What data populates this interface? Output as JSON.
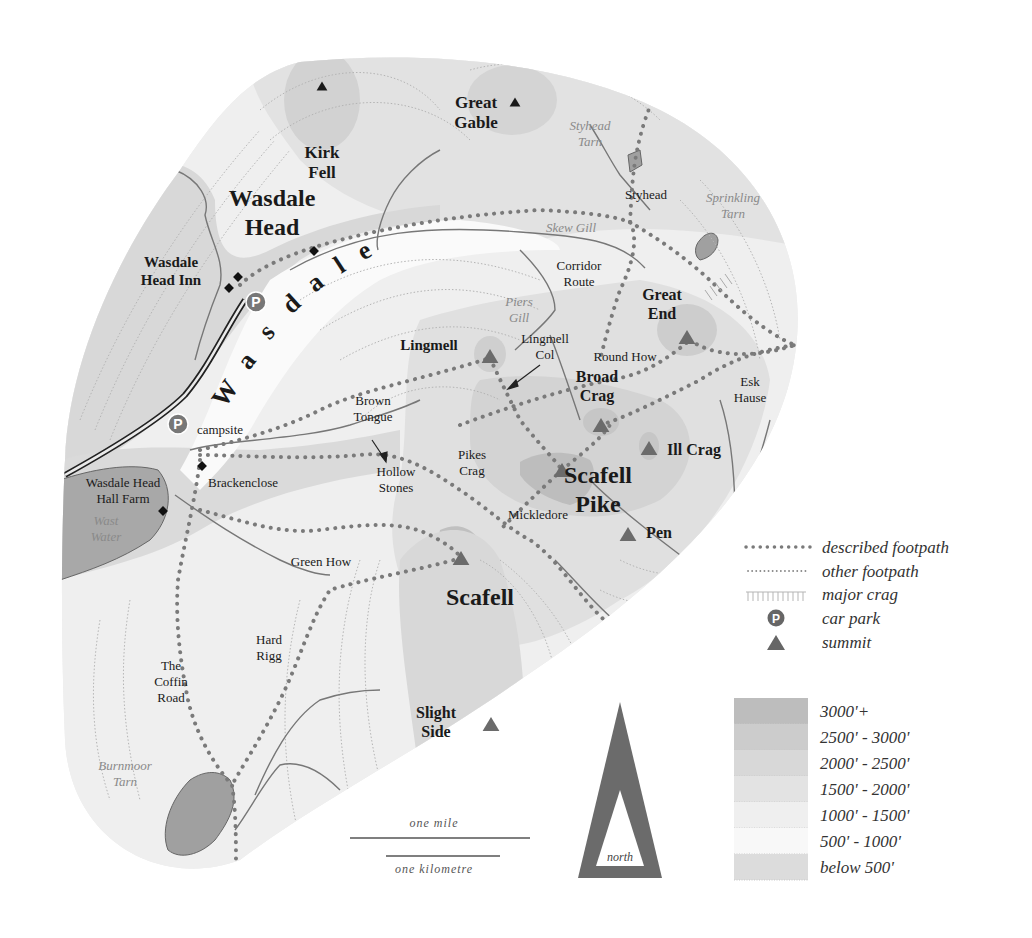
{
  "colors": {
    "summit": "#6b6b6b",
    "summit_dark": "#1a1a1a",
    "path": "#7d7d7d",
    "stream": "#777777",
    "water": "#9a9a9a",
    "road": "#2a2a2a",
    "band_3000": "#bdbdbd",
    "band_2500": "#cccccc",
    "band_2000": "#d8d8d8",
    "band_1500": "#e3e3e3",
    "band_1000": "#ededed",
    "band_500": "#f6f6f6",
    "band_below500": "#dcdcdc",
    "contour": "#b0b0b0"
  },
  "map": {
    "labels": [
      {
        "id": "kirk-fell",
        "lines": [
          "Kirk",
          "Fell"
        ],
        "x": 322,
        "y": 158,
        "size": 17,
        "style": "bold"
      },
      {
        "id": "great-gable",
        "lines": [
          "Great",
          "Gable"
        ],
        "x": 476,
        "y": 108,
        "size": 17,
        "style": "bold"
      },
      {
        "id": "styhead-tarn",
        "lines": [
          "Styhead",
          "Tarn"
        ],
        "x": 590,
        "y": 130,
        "size": 13,
        "style": "italic-grey"
      },
      {
        "id": "wasdale-head",
        "lines": [
          "Wasdale",
          "Head"
        ],
        "x": 272,
        "y": 206,
        "size": 24,
        "style": "bold"
      },
      {
        "id": "styhead",
        "lines": [
          "Styhead"
        ],
        "x": 646,
        "y": 199,
        "size": 13,
        "style": "normal"
      },
      {
        "id": "sprinkling-tarn",
        "lines": [
          "Sprinkling",
          "Tarn"
        ],
        "x": 733,
        "y": 202,
        "size": 13,
        "style": "italic-grey"
      },
      {
        "id": "skew-gill",
        "lines": [
          "Skew Gill"
        ],
        "x": 571,
        "y": 232,
        "size": 13,
        "style": "italic-grey"
      },
      {
        "id": "wasdale-head-inn",
        "lines": [
          "Wasdale",
          "Head Inn"
        ],
        "x": 171,
        "y": 267,
        "size": 15,
        "style": "bold"
      },
      {
        "id": "corridor-route",
        "lines": [
          "Corridor",
          "Route"
        ],
        "x": 579,
        "y": 270,
        "size": 13,
        "style": "normal"
      },
      {
        "id": "great-end",
        "lines": [
          "Great",
          "End"
        ],
        "x": 662,
        "y": 300,
        "size": 16,
        "style": "bold"
      },
      {
        "id": "piers-gill",
        "lines": [
          "Piers",
          "Gill"
        ],
        "x": 519,
        "y": 306,
        "size": 13,
        "style": "italic-grey"
      },
      {
        "id": "lingmell",
        "lines": [
          "Lingmell"
        ],
        "x": 429,
        "y": 350,
        "size": 15,
        "style": "bold"
      },
      {
        "id": "lingmell-col",
        "lines": [
          "Lingmell",
          "Col"
        ],
        "x": 545,
        "y": 343,
        "size": 13,
        "style": "normal"
      },
      {
        "id": "round-how",
        "lines": [
          "Round How"
        ],
        "x": 625,
        "y": 361,
        "size": 13,
        "style": "normal"
      },
      {
        "id": "broad-crag",
        "lines": [
          "Broad",
          "Crag"
        ],
        "x": 597,
        "y": 382,
        "size": 16,
        "style": "bold"
      },
      {
        "id": "esk-hause",
        "lines": [
          "Esk",
          "Hause"
        ],
        "x": 750,
        "y": 386,
        "size": 13,
        "style": "normal"
      },
      {
        "id": "brown-tongue",
        "lines": [
          "Brown",
          "Tongue"
        ],
        "x": 373,
        "y": 405,
        "size": 13,
        "style": "normal"
      },
      {
        "id": "ill-crag",
        "lines": [
          "Ill Crag"
        ],
        "x": 694,
        "y": 455,
        "size": 16,
        "style": "bold"
      },
      {
        "id": "campsite",
        "lines": [
          "campsite"
        ],
        "x": 220,
        "y": 434,
        "size": 13,
        "style": "normal"
      },
      {
        "id": "pikes-crag",
        "lines": [
          "Pikes",
          "Crag"
        ],
        "x": 472,
        "y": 459,
        "size": 13,
        "style": "normal"
      },
      {
        "id": "hollow-stones",
        "lines": [
          "Hollow",
          "Stones"
        ],
        "x": 396,
        "y": 476,
        "size": 13,
        "style": "normal"
      },
      {
        "id": "scafell-pike",
        "lines": [
          "Scafell",
          "Pike"
        ],
        "x": 598,
        "y": 483,
        "size": 24,
        "style": "bold"
      },
      {
        "id": "wasdale-head-hall-farm",
        "lines": [
          "Wasdale Head",
          "Hall Farm"
        ],
        "x": 123,
        "y": 487,
        "size": 13,
        "style": "normal"
      },
      {
        "id": "brackenclose",
        "lines": [
          "Brackenclose"
        ],
        "x": 243,
        "y": 487,
        "size": 13,
        "style": "normal"
      },
      {
        "id": "wast-water",
        "lines": [
          "Wast",
          "Water"
        ],
        "x": 106,
        "y": 525,
        "size": 13,
        "style": "italic-grey"
      },
      {
        "id": "mickledore",
        "lines": [
          "Mickledore"
        ],
        "x": 538,
        "y": 519,
        "size": 13,
        "style": "normal"
      },
      {
        "id": "pen",
        "lines": [
          "Pen"
        ],
        "x": 659,
        "y": 538,
        "size": 16,
        "style": "bold"
      },
      {
        "id": "green-how",
        "lines": [
          "Green How"
        ],
        "x": 321,
        "y": 566,
        "size": 13,
        "style": "normal"
      },
      {
        "id": "scafell",
        "lines": [
          "Scafell"
        ],
        "x": 480,
        "y": 605,
        "size": 24,
        "style": "bold"
      },
      {
        "id": "hard-rigg",
        "lines": [
          "Hard",
          "Rigg"
        ],
        "x": 269,
        "y": 644,
        "size": 13,
        "style": "normal"
      },
      {
        "id": "the-coffin-road",
        "lines": [
          "The",
          "Coffin",
          "Road"
        ],
        "x": 171,
        "y": 670,
        "size": 13,
        "style": "normal"
      },
      {
        "id": "slight-side",
        "lines": [
          "Slight",
          "Side"
        ],
        "x": 436,
        "y": 718,
        "size": 16,
        "style": "bold"
      },
      {
        "id": "burnmoor-tarn",
        "lines": [
          "Burnmoor",
          "Tarn"
        ],
        "x": 125,
        "y": 770,
        "size": 13,
        "style": "italic-grey"
      }
    ],
    "valley_letters": [
      {
        "ch": "W",
        "x": 232,
        "y": 398,
        "rot": -55
      },
      {
        "ch": "a",
        "x": 253,
        "y": 366,
        "rot": -52
      },
      {
        "ch": "s",
        "x": 273,
        "y": 337,
        "rot": -48
      },
      {
        "ch": "d",
        "x": 297,
        "y": 310,
        "rot": -42
      },
      {
        "ch": "a",
        "x": 320,
        "y": 289,
        "rot": -38
      },
      {
        "ch": "l",
        "x": 344,
        "y": 272,
        "rot": -33
      },
      {
        "ch": "e",
        "x": 368,
        "y": 258,
        "rot": -28
      }
    ],
    "summits": [
      {
        "id": "kirk-fell-summit",
        "x": 322,
        "y": 86,
        "size": 9,
        "dark": true
      },
      {
        "id": "great-gable-summit",
        "x": 515,
        "y": 102,
        "size": 9,
        "dark": true
      },
      {
        "id": "great-end-summit",
        "x": 687,
        "y": 337,
        "size": 14,
        "dark": false
      },
      {
        "id": "lingmell-summit",
        "x": 490,
        "y": 356,
        "size": 14,
        "dark": false
      },
      {
        "id": "broad-crag-summit",
        "x": 601,
        "y": 425,
        "size": 14,
        "dark": false
      },
      {
        "id": "ill-crag-summit",
        "x": 649,
        "y": 448,
        "size": 14,
        "dark": false
      },
      {
        "id": "scafell-pike-summit",
        "x": 562,
        "y": 470,
        "size": 14,
        "dark": false
      },
      {
        "id": "pen-summit",
        "x": 628,
        "y": 534,
        "size": 14,
        "dark": false
      },
      {
        "id": "scafell-summit",
        "x": 461,
        "y": 558,
        "size": 14,
        "dark": false
      },
      {
        "id": "slight-side-summit",
        "x": 491,
        "y": 724,
        "size": 14,
        "dark": false
      }
    ],
    "car_parks": [
      {
        "id": "car-park-wasdale-head",
        "x": 256,
        "y": 302
      },
      {
        "id": "car-park-campsite",
        "x": 178,
        "y": 424
      }
    ],
    "buildings": [
      {
        "id": "building-1",
        "x": 314,
        "y": 251
      },
      {
        "id": "building-2",
        "x": 238,
        "y": 277
      },
      {
        "id": "building-3",
        "x": 229,
        "y": 288
      },
      {
        "id": "building-brackenclose",
        "x": 202,
        "y": 466
      },
      {
        "id": "building-hall-farm",
        "x": 163,
        "y": 511
      }
    ],
    "car_park_glyph": "P"
  },
  "legend": {
    "items": [
      {
        "id": "described-footpath",
        "label": "described footpath"
      },
      {
        "id": "other-footpath",
        "label": "other footpath"
      },
      {
        "id": "major-crag",
        "label": "major crag"
      },
      {
        "id": "car-park",
        "label": "car park"
      },
      {
        "id": "summit",
        "label": "summit"
      }
    ],
    "bands": [
      {
        "id": "band-3000",
        "label": "3000'+",
        "color": "#bdbdbd"
      },
      {
        "id": "band-2500",
        "label": "2500' - 3000'",
        "color": "#cccccc"
      },
      {
        "id": "band-2000",
        "label": "2000' - 2500'",
        "color": "#d8d8d8"
      },
      {
        "id": "band-1500",
        "label": "1500' - 2000'",
        "color": "#e3e3e3"
      },
      {
        "id": "band-1000",
        "label": "1000' - 1500'",
        "color": "#efefef"
      },
      {
        "id": "band-500",
        "label": "500' - 1000'",
        "color": "#f8f8f8"
      },
      {
        "id": "band-below500",
        "label": "below 500'",
        "color": "#dcdcdc"
      }
    ]
  },
  "scale": {
    "mile_label": "one mile",
    "km_label": "one kilometre"
  },
  "north_arrow": {
    "label": "north"
  }
}
